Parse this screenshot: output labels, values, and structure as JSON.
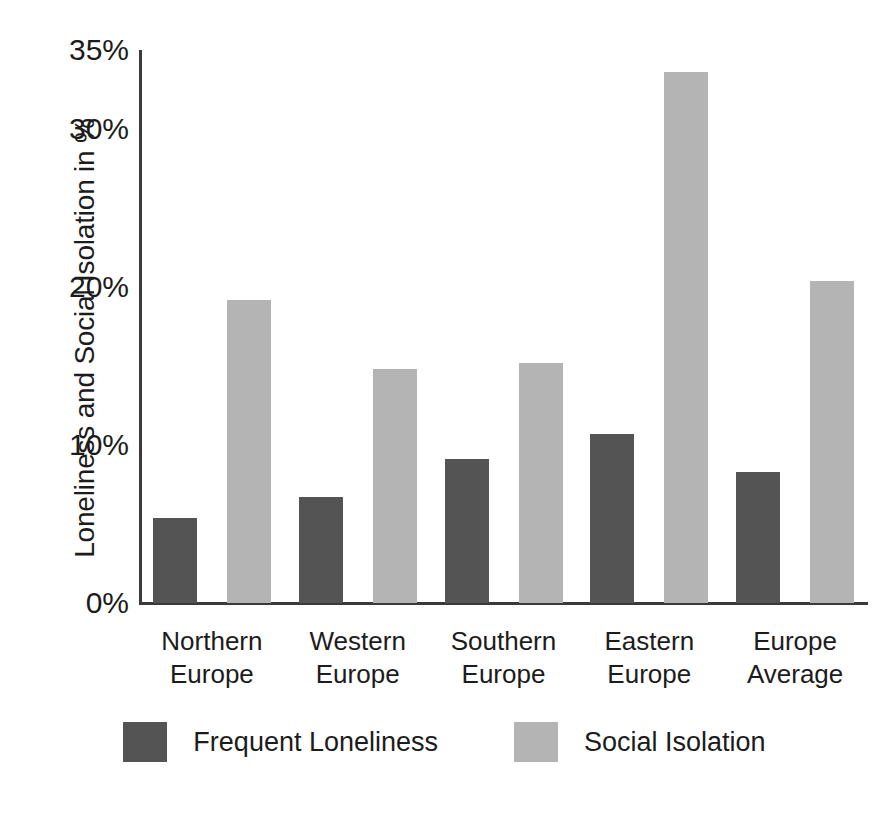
{
  "chart_data": {
    "type": "bar",
    "title": "",
    "xlabel": "",
    "ylabel": "Loneliness and Social Isolation in %",
    "categories": [
      "Northern Europe",
      "Western Europe",
      "Southern Europe",
      "Eastern Europe",
      "Europe Average"
    ],
    "category_lines": [
      [
        "Northern",
        "Europe"
      ],
      [
        "Western",
        "Europe"
      ],
      [
        "Southern",
        "Europe"
      ],
      [
        "Eastern",
        "Europe"
      ],
      [
        "Europe",
        "Average"
      ]
    ],
    "series": [
      {
        "name": "Frequent Loneliness",
        "color": "#545454",
        "values": [
          5.4,
          6.7,
          9.1,
          10.7,
          8.3
        ]
      },
      {
        "name": "Social Isolation",
        "color": "#b4b4b4",
        "values": [
          19.2,
          14.8,
          15.2,
          33.6,
          20.4
        ]
      }
    ],
    "ylim": [
      0,
      35
    ],
    "yticks": [
      0,
      10,
      20,
      30,
      35
    ],
    "ytick_labels": [
      "0%",
      "10%",
      "20%",
      "30%",
      "35%"
    ],
    "grid": false,
    "legend_position": "bottom",
    "axis_color": "#3a3a3a",
    "background": "#ffffff"
  },
  "legend": {
    "items": [
      {
        "label": "Frequent Loneliness",
        "color": "#545454"
      },
      {
        "label": "Social Isolation",
        "color": "#b4b4b4"
      }
    ]
  }
}
